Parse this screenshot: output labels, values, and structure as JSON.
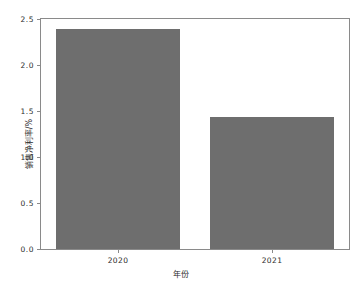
{
  "chart_data": {
    "type": "bar",
    "title": "",
    "categories": [
      "2020",
      "2021"
    ],
    "values": [
      2.39,
      1.44
    ],
    "series": [
      {
        "name": "销售净利率",
        "values": [
          2.39,
          1.44
        ]
      }
    ],
    "xlabel": "年份",
    "ylabel": "销售净利率/%",
    "ylim": [
      0.0,
      2.5
    ],
    "yticks": [
      "0.0",
      "0.5",
      "1.0",
      "1.5",
      "2.0",
      "2.5"
    ],
    "ytick_values": [
      0.0,
      0.5,
      1.0,
      1.5,
      2.0,
      2.5
    ],
    "xticks": [
      "2020",
      "2021"
    ],
    "grid": false,
    "legend": false,
    "bar_color": "#6e6e6e",
    "background_color": "#ffffff",
    "axis_color": "#8a8a8a"
  }
}
